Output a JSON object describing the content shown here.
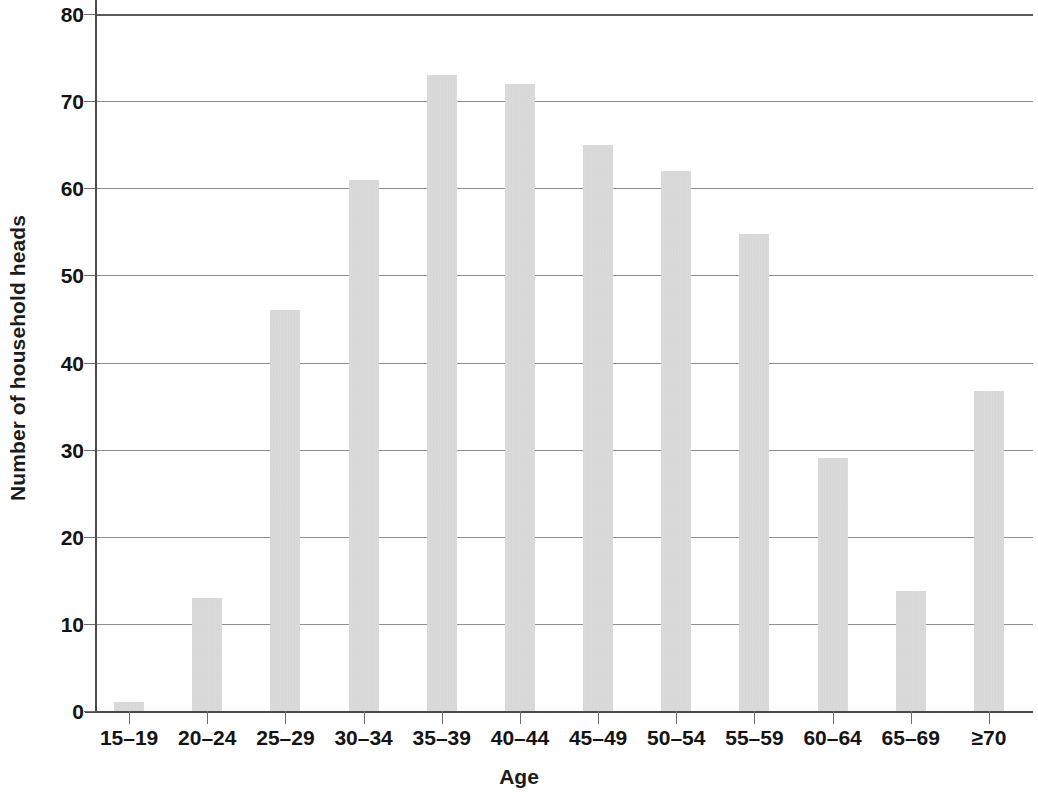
{
  "chart_data": {
    "type": "bar",
    "title": "",
    "xlabel": "Age",
    "ylabel": "Number of household heads",
    "categories": [
      "15–19",
      "20–24",
      "25–29",
      "30–34",
      "35–39",
      "40–44",
      "45–49",
      "50–54",
      "55–59",
      "60–64",
      "65–69",
      "≥70"
    ],
    "values": [
      1,
      13,
      46,
      61,
      73,
      72,
      65,
      62,
      54.7,
      29,
      13.8,
      36.7
    ],
    "series": [
      {
        "name": "Number of household heads",
        "values": [
          1,
          13,
          46,
          61,
          73,
          72,
          65,
          62,
          54.7,
          29,
          13.8,
          36.7
        ]
      }
    ],
    "ylim": [
      0,
      80
    ],
    "ytick_labels": [
      "0",
      "10",
      "20",
      "30",
      "40",
      "50",
      "60",
      "70",
      "80"
    ],
    "ytick_values": [
      0,
      10,
      20,
      30,
      40,
      50,
      60,
      70,
      80
    ],
    "grid": "horizontal",
    "legend": "none",
    "bar_color": "#d2d2d2",
    "axis_color": "#4a4a4a",
    "gridline_color": "#8e8e8e",
    "text_color": "#141414"
  }
}
